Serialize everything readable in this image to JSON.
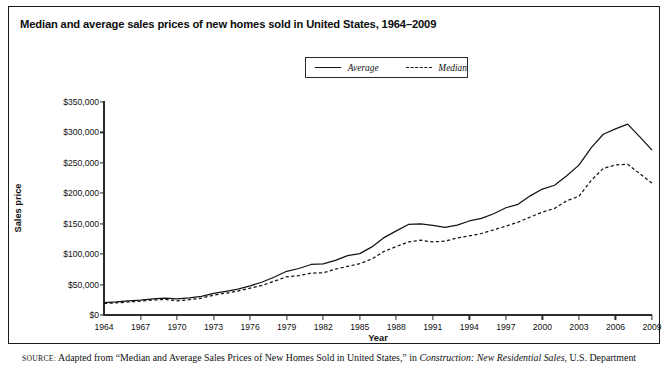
{
  "figure": {
    "title": "Median and average sales prices of new homes sold in United States, 1964–2009",
    "source_prefix": "SOURCE:",
    "source_text_1": " Adapted from “Median and Average Sales Prices of New Homes Sold in United States,” in ",
    "source_italic": "Construction: New Residential Sales",
    "source_text_2": ", U.S. Department"
  },
  "legend": {
    "position": "top-center",
    "entries": [
      {
        "label": "Average",
        "style": "solid",
        "icon": "solid-line-swatch"
      },
      {
        "label": "Median",
        "style": "dashed",
        "icon": "dashed-line-swatch"
      }
    ]
  },
  "axes": {
    "ylabel": "Sales price",
    "xlabel": "Year",
    "yticks": [
      "$0",
      "$50,000",
      "$100,000",
      "$150,000",
      "$200,000",
      "$250,000",
      "$300,000",
      "$350,000"
    ],
    "ytick_values": [
      0,
      50000,
      100000,
      150000,
      200000,
      250000,
      300000,
      350000
    ],
    "xticks": [
      "1964",
      "1967",
      "1970",
      "1973",
      "1976",
      "1979",
      "1982",
      "1985",
      "1988",
      "1991",
      "1994",
      "1997",
      "2000",
      "2003",
      "2006",
      "2009"
    ],
    "xtick_values": [
      1964,
      1967,
      1970,
      1973,
      1976,
      1979,
      1982,
      1985,
      1988,
      1991,
      1994,
      1997,
      2000,
      2003,
      2006,
      2009
    ]
  },
  "chart_data": {
    "type": "line",
    "title": "Median and average sales prices of new homes sold in United States, 1964–2009",
    "xlabel": "Year",
    "ylabel": "Sales price",
    "xlim": [
      1964,
      2009
    ],
    "ylim": [
      0,
      350000
    ],
    "grid": false,
    "legend_position": "top-center",
    "x": [
      1964,
      1965,
      1966,
      1967,
      1968,
      1969,
      1970,
      1971,
      1972,
      1973,
      1974,
      1975,
      1976,
      1977,
      1978,
      1979,
      1980,
      1981,
      1982,
      1983,
      1984,
      1985,
      1986,
      1987,
      1988,
      1989,
      1990,
      1991,
      1992,
      1993,
      1994,
      1995,
      1996,
      1997,
      1998,
      1999,
      2000,
      2001,
      2002,
      2003,
      2004,
      2005,
      2006,
      2007,
      2008,
      2009
    ],
    "series": [
      {
        "name": "Average",
        "style": "solid",
        "values": [
          20500,
          21500,
          23300,
          24600,
          26600,
          27900,
          26600,
          28300,
          30500,
          35500,
          38900,
          42600,
          48000,
          54200,
          62500,
          71800,
          76400,
          83000,
          83900,
          89800,
          97600,
          100800,
          111900,
          127200,
          138300,
          148800,
          149800,
          147200,
          144100,
          147700,
          154500,
          158700,
          166400,
          176200,
          181900,
          195800,
          207000,
          213200,
          228700,
          246300,
          274500,
          297000,
          305900,
          313600,
          292600,
          270900
        ]
      },
      {
        "name": "Median",
        "style": "dashed",
        "values": [
          18900,
          20000,
          21400,
          22700,
          24700,
          25600,
          23400,
          25200,
          27600,
          32500,
          35900,
          39300,
          44200,
          48800,
          55700,
          62900,
          64600,
          68900,
          69300,
          75300,
          79900,
          84300,
          92000,
          104500,
          112500,
          120000,
          122900,
          120000,
          121500,
          126500,
          130000,
          133900,
          140000,
          146000,
          152500,
          161000,
          169000,
          175200,
          187600,
          195000,
          221000,
          240900,
          246500,
          247900,
          232100,
          216700
        ]
      }
    ]
  }
}
